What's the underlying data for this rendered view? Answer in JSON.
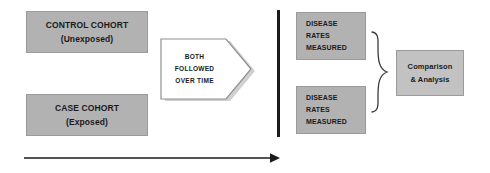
{
  "diagram": {
    "palette": {
      "cohort_fill": "#b2b2b2",
      "analysis_fill": "#c2c2c2",
      "shadow": "#d8d8d8",
      "outline": "#9a9a9a",
      "ink": "#1b1b1b"
    }
  },
  "control_cohort": {
    "line1": "CONTROL COHORT",
    "line2": "(Unexposed)"
  },
  "case_cohort": {
    "line1": "CASE COHORT",
    "line2": "(Exposed)"
  },
  "followup_arrow": {
    "line1": "BOTH",
    "line2": "FOLLOWED",
    "line3": "OVER TIME"
  },
  "measurement_top": {
    "line1": "DISEASE",
    "line2": "RATES",
    "line3": "MEASURED"
  },
  "measurement_bottom": {
    "line1": "DISEASE",
    "line2": "RATES",
    "line3": "MEASURED"
  },
  "analysis": {
    "line1": "Comparison",
    "line2": "& Analysis"
  },
  "icons": {
    "divider": "vertical-bar-icon",
    "brace": "right-curly-brace-icon",
    "timeline": "right-arrow-icon"
  }
}
